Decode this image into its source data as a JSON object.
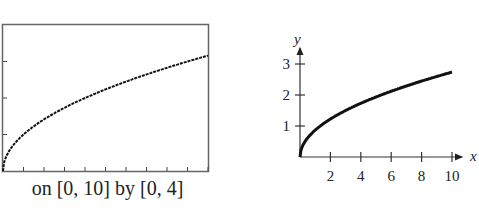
{
  "chart_data": [
    {
      "type": "line",
      "title": "",
      "caption": "on [0, 10] by [0, 4]",
      "xlabel": "",
      "ylabel": "",
      "xlim": [
        0,
        10
      ],
      "ylim": [
        0,
        4
      ],
      "xticks": [
        1,
        2,
        3,
        4,
        5,
        6,
        7,
        8,
        9,
        10
      ],
      "yticks": [
        1,
        2,
        3
      ],
      "grid": false,
      "series": [
        {
          "name": "y = sqrt(x)",
          "x": [
            0,
            0.1,
            0.5,
            1,
            2,
            3,
            4,
            5,
            6,
            7,
            8,
            9,
            10
          ],
          "y": [
            0,
            0.32,
            0.71,
            1,
            1.41,
            1.73,
            2,
            2.24,
            2.45,
            2.65,
            2.83,
            3,
            3.16
          ]
        }
      ]
    },
    {
      "type": "line",
      "title": "",
      "xlabel": "x",
      "ylabel": "y",
      "xlim": [
        0,
        10.8
      ],
      "ylim": [
        0,
        3.6
      ],
      "xticks": [
        2,
        4,
        6,
        8,
        10
      ],
      "xtick_labels": [
        "2",
        "4",
        "6",
        "8",
        "10"
      ],
      "yticks": [
        1,
        2,
        3
      ],
      "ytick_labels": [
        "1",
        "2",
        "3"
      ],
      "grid": false,
      "series": [
        {
          "name": "curve",
          "x": [
            0,
            0.1,
            0.5,
            1,
            2,
            3,
            4,
            5,
            6,
            7,
            8,
            9,
            10
          ],
          "y": [
            0,
            0.27,
            0.61,
            0.86,
            1.22,
            1.5,
            1.73,
            1.94,
            2.12,
            2.29,
            2.45,
            2.6,
            2.74
          ]
        }
      ]
    }
  ]
}
